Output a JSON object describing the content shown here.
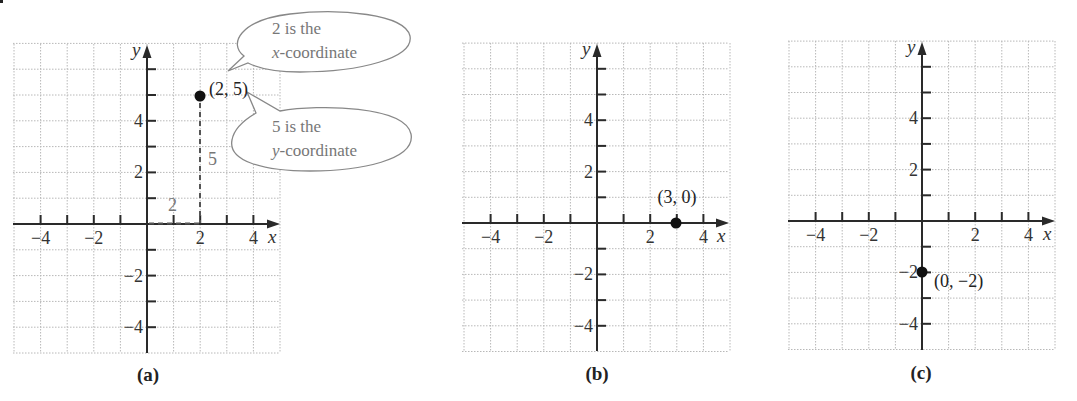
{
  "figure": {
    "panels": [
      {
        "id": "a",
        "label": "(a)",
        "point": {
          "x": 2,
          "y": 5,
          "label": "(2, 5)"
        },
        "guides": {
          "horizontal_label": "2",
          "vertical_label": "5"
        },
        "callouts": [
          {
            "line1": "2 is the",
            "line2_italic": "x",
            "line2_rest": "-coordinate"
          },
          {
            "line1": "5 is the",
            "line2_italic": "y",
            "line2_rest": "-coordinate"
          }
        ]
      },
      {
        "id": "b",
        "label": "(b)",
        "point": {
          "x": 3,
          "y": 0,
          "label": "(3, 0)"
        }
      },
      {
        "id": "c",
        "label": "(c)",
        "point": {
          "x": 0,
          "y": -2,
          "label": "(0, −2)"
        }
      }
    ],
    "axes": {
      "x_label": "x",
      "y_label": "y",
      "x_tick_labels": [
        "−4",
        "−2",
        "2",
        "4"
      ],
      "y_tick_labels": [
        "4",
        "2",
        "−2",
        "−4"
      ]
    }
  },
  "chart_data": [
    {
      "type": "scatter",
      "title": "(a)",
      "xlabel": "x",
      "ylabel": "y",
      "xlim": [
        -5,
        5
      ],
      "ylim": [
        -5,
        7
      ],
      "grid": true,
      "x_ticks": [
        -4,
        -2,
        2,
        4
      ],
      "y_ticks": [
        4,
        2,
        -2,
        -4
      ],
      "points": [
        {
          "x": 2,
          "y": 5,
          "label": "(2, 5)"
        }
      ],
      "annotations": [
        "2 is the x-coordinate",
        "5 is the y-coordinate",
        "dashed segment from origin to x = 2 labeled 2",
        "dashed segment from (2, 0) to (2, 5) labeled 5"
      ]
    },
    {
      "type": "scatter",
      "title": "(b)",
      "xlabel": "x",
      "ylabel": "y",
      "xlim": [
        -5,
        5
      ],
      "ylim": [
        -5,
        7
      ],
      "grid": true,
      "x_ticks": [
        -4,
        -2,
        2,
        4
      ],
      "y_ticks": [
        4,
        2,
        -2,
        -4
      ],
      "points": [
        {
          "x": 3,
          "y": 0,
          "label": "(3, 0)"
        }
      ]
    },
    {
      "type": "scatter",
      "title": "(c)",
      "xlabel": "x",
      "ylabel": "y",
      "xlim": [
        -5,
        5
      ],
      "ylim": [
        -5,
        7
      ],
      "grid": true,
      "x_ticks": [
        -4,
        -2,
        2,
        4
      ],
      "y_ticks": [
        4,
        2,
        -2,
        -4
      ],
      "points": [
        {
          "x": 0,
          "y": -2,
          "label": "(0, −2)"
        }
      ]
    }
  ]
}
